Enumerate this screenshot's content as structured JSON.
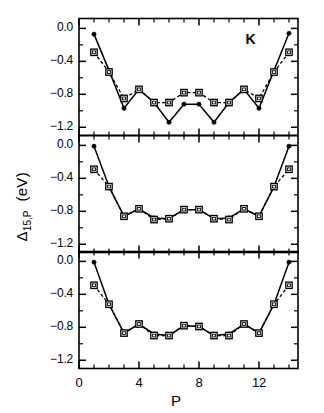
{
  "axes": {
    "ylabel_main": "Δ",
    "ylabel_sub": "15,P",
    "ylabel_unit": "(eV)",
    "xlabel": "P",
    "y_ticks": [
      "0.0",
      "−0.4",
      "−0.8",
      "−1.2"
    ],
    "x_ticks": [
      "0",
      "4",
      "8",
      "12"
    ]
  },
  "annotations": {
    "panel_top": "K"
  },
  "colors": {
    "line": "#000000",
    "frame": "#000000",
    "background": "#ffffff",
    "open_marker_fill": "#ffffff"
  },
  "chart_data": {
    "type": "line",
    "title": "",
    "xlabel": "P",
    "ylabel": "Δ15,P (eV)",
    "xlim": [
      0,
      14.6
    ],
    "ylim": [
      -1.3,
      0.12
    ],
    "x_ticks": [
      0,
      4,
      8,
      12
    ],
    "y_ticks": [
      0.0,
      -0.4,
      -0.8,
      -1.2
    ],
    "grid": false,
    "legend_position": "none",
    "panel_annotation": "K",
    "x": [
      1,
      2,
      3,
      4,
      5,
      6,
      7,
      8,
      9,
      10,
      11,
      12,
      13,
      14
    ],
    "panels": [
      {
        "name": "top",
        "annotation": "K",
        "series": [
          {
            "name": "solid-circles",
            "marker": "filled-circle",
            "linestyle": "solid",
            "values": [
              -0.07,
              -0.51,
              -0.97,
              -0.74,
              -0.9,
              -1.14,
              -0.92,
              -0.92,
              -1.14,
              -0.9,
              -0.74,
              -0.97,
              -0.51,
              -0.06
            ]
          },
          {
            "name": "dashed-squares",
            "marker": "open-square",
            "linestyle": "dashed",
            "values": [
              -0.29,
              -0.53,
              -0.85,
              -0.74,
              -0.9,
              -0.9,
              -0.78,
              -0.78,
              -0.9,
              -0.9,
              -0.74,
              -0.85,
              -0.53,
              -0.29
            ]
          }
        ]
      },
      {
        "name": "middle",
        "annotation": "",
        "series": [
          {
            "name": "solid-circles",
            "marker": "filled-circle",
            "linestyle": "solid",
            "values": [
              -0.01,
              -0.5,
              -0.86,
              -0.77,
              -0.88,
              -0.89,
              -0.78,
              -0.78,
              -0.89,
              -0.88,
              -0.77,
              -0.86,
              -0.5,
              -0.01
            ]
          },
          {
            "name": "dashed-squares",
            "marker": "open-square",
            "linestyle": "dashed",
            "values": [
              -0.29,
              -0.5,
              -0.86,
              -0.77,
              -0.9,
              -0.89,
              -0.78,
              -0.78,
              -0.89,
              -0.9,
              -0.77,
              -0.86,
              -0.5,
              -0.29
            ]
          }
        ]
      },
      {
        "name": "bottom",
        "annotation": "",
        "series": [
          {
            "name": "solid-circles",
            "marker": "filled-circle",
            "linestyle": "solid",
            "values": [
              -0.01,
              -0.52,
              -0.87,
              -0.76,
              -0.88,
              -0.9,
              -0.78,
              -0.79,
              -0.9,
              -0.88,
              -0.76,
              -0.87,
              -0.52,
              -0.01
            ]
          },
          {
            "name": "dashed-squares",
            "marker": "open-square",
            "linestyle": "dashed",
            "values": [
              -0.29,
              -0.52,
              -0.87,
              -0.76,
              -0.9,
              -0.9,
              -0.78,
              -0.79,
              -0.9,
              -0.9,
              -0.76,
              -0.87,
              -0.52,
              -0.29
            ]
          }
        ]
      }
    ]
  }
}
